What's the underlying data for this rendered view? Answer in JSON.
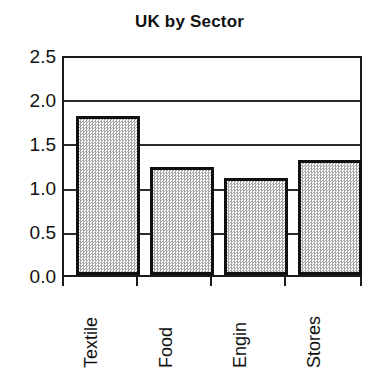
{
  "chart_data": {
    "type": "bar",
    "title": "UK by Sector",
    "xlabel": "",
    "ylabel": "",
    "categories": [
      "Textile",
      "Food",
      "Engin",
      "Stores"
    ],
    "values": [
      1.83,
      1.25,
      1.12,
      1.33
    ],
    "ylim": [
      0.0,
      2.5
    ],
    "ytick_labels": [
      "0.0",
      "0.5",
      "1.0",
      "1.5",
      "2.0",
      "2.5"
    ],
    "ytick_values": [
      0.0,
      0.5,
      1.0,
      1.5,
      2.0,
      2.5
    ],
    "grid": true,
    "grid_axis": "y",
    "legend": false,
    "legend_position": "none",
    "bar_fill_color": "#d2d2d2",
    "bar_edge_color": "#101010",
    "axis_color": "#1a1a1a",
    "background_color": "#ffffff",
    "xtick_label_rotation": 90
  },
  "axis": {
    "y": {
      "t0": "0.0",
      "t1": "0.5",
      "t2": "1.0",
      "t3": "1.5",
      "t4": "2.0",
      "t5": "2.5"
    },
    "x": {
      "t0": "Textile",
      "t1": "Food",
      "t2": "Engin",
      "t3": "Stores"
    }
  }
}
